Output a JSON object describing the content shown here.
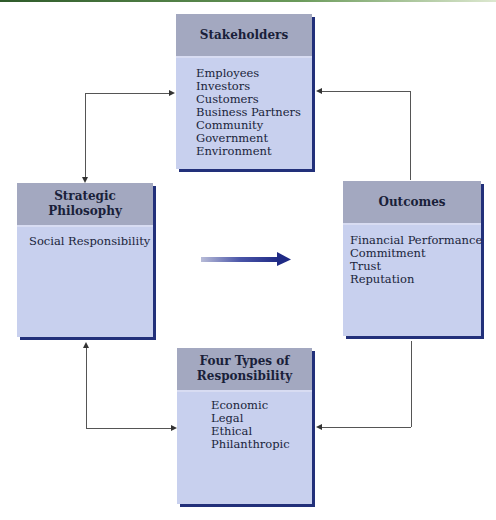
{
  "diagram": {
    "stakeholders": {
      "title": "Stakeholders",
      "items": [
        "Employees",
        "Investors",
        "Customers",
        "Business Partners",
        "Community",
        "Government",
        "Environment"
      ]
    },
    "strategic_philosophy": {
      "title": "Strategic Philosophy",
      "items": [
        "Social Responsibility"
      ]
    },
    "outcomes": {
      "title": "Outcomes",
      "items": [
        "Financial Performance",
        "Commitment",
        "Trust",
        "Reputation"
      ]
    },
    "four_types": {
      "title": "Four Types of Responsibility",
      "items": [
        "Economic",
        "Legal",
        "Ethical",
        "Philanthropic"
      ]
    },
    "connections": [
      {
        "from": "Strategic Philosophy",
        "to": "Stakeholders",
        "bidirectional": true
      },
      {
        "from": "Outcomes",
        "to": "Stakeholders",
        "bidirectional": false
      },
      {
        "from": "Strategic Philosophy",
        "to": "Four Types of Responsibility",
        "bidirectional": true
      },
      {
        "from": "Outcomes",
        "to": "Four Types of Responsibility",
        "bidirectional": false
      },
      {
        "from": "Strategic Philosophy",
        "to": "Outcomes",
        "type": "center-arrow"
      }
    ],
    "colors": {
      "box_body": "#c8d0ee",
      "box_header": "#a3a8c0",
      "box_shadow": "#22307a",
      "arrow": "#2a3590"
    }
  }
}
